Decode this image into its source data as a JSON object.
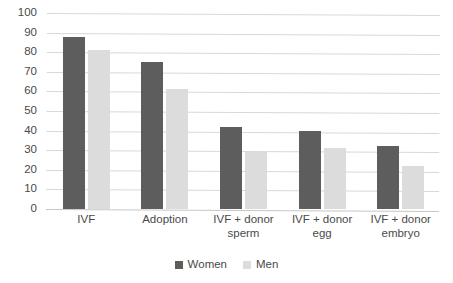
{
  "chart_data": {
    "type": "bar",
    "title": "",
    "subtitle": "",
    "xlabel": "",
    "ylabel": "",
    "ylim": [
      0,
      100
    ],
    "ytick_step": 10,
    "yticks": [
      100,
      90,
      80,
      70,
      60,
      50,
      40,
      30,
      20,
      10,
      0
    ],
    "grid": true,
    "legend_position": "bottom",
    "categories": [
      "IVF",
      "Adoption",
      "IVF + donor sperm",
      "IVF + donor egg",
      "IVF + donor embryo"
    ],
    "series": [
      {
        "name": "Women",
        "color": "#5d5d5d",
        "values": [
          88,
          75,
          42,
          40,
          32
        ]
      },
      {
        "name": "Men",
        "color": "#dcdcdc",
        "values": [
          81,
          61,
          29,
          31,
          22
        ]
      }
    ]
  },
  "legend": {
    "entries": [
      {
        "label": "Women",
        "color": "#5d5d5d"
      },
      {
        "label": "Men",
        "color": "#dcdcdc"
      }
    ]
  },
  "axis": {
    "y_tick_labels": [
      "100",
      "90",
      "80",
      "70",
      "60",
      "50",
      "40",
      "30",
      "20",
      "10",
      "0"
    ],
    "x_tick_labels": [
      "IVF",
      "Adoption",
      "IVF + donor sperm",
      "IVF + donor egg",
      "IVF + donor embryo"
    ]
  }
}
